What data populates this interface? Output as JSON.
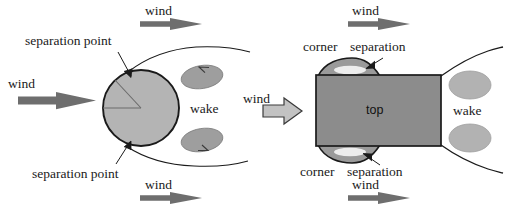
{
  "figure": {
    "background_color": "#ffffff",
    "ink_color": "#1a1a1a"
  },
  "palette": {
    "body_fill_circle": "#b4b4b4",
    "body_fill_rect": "#8c8c8c",
    "bubble_fill": "#9a9a9a",
    "bubble_core": "#ededed",
    "wake_fill_left": "#9e9e9e",
    "wake_fill_right": "#b2b2b2",
    "arrow_solid": "#6e6e6e",
    "arrow_block_fill": "#c2c2c2",
    "outline": "#1a1a1a"
  },
  "left_diagram": {
    "name": "circular-cylinder",
    "body_label": "",
    "labels": {
      "wind_top": "wind",
      "wind_left": "wind",
      "wind_bottom": "wind",
      "separation_point_top": "separation point",
      "separation_point_bottom": "separation point",
      "wake": "wake"
    }
  },
  "middle": {
    "wind_label": "wind"
  },
  "right_diagram": {
    "name": "rectangular-section",
    "body_label": "top",
    "labels": {
      "wind_top": "wind",
      "wind_bottom": "wind",
      "corner_top": "corner",
      "separation_top": "separation",
      "corner_bottom": "corner",
      "separation_bottom": "separation",
      "wake": "wake"
    }
  }
}
